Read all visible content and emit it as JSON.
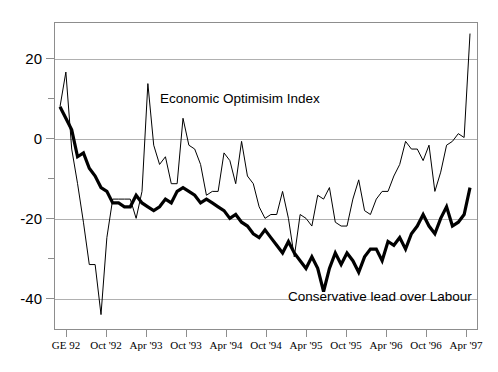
{
  "chart_data": {
    "type": "line",
    "title": "",
    "xlabel": "",
    "ylabel": "",
    "ylim": [
      -50,
      30
    ],
    "yticks": [
      20,
      0,
      -20,
      -40
    ],
    "ytick_labels": [
      "20",
      "0",
      "-20",
      "-40"
    ],
    "yticks_minor": [
      10,
      -10,
      -30
    ],
    "grid": true,
    "legend_position": "inline-annotations",
    "x_tick_labels": [
      "GE 92",
      "Oct '92",
      "Apr '93",
      "Oct '93",
      "Apr '94",
      "Oct '94",
      "Apr '95",
      "Oct '95",
      "Apr '96",
      "Oct '96",
      "Apr '97"
    ],
    "series": [
      {
        "name": "Economic Optimisim Index",
        "style": "thin",
        "color": "#000000",
        "values": [
          8,
          17,
          -3,
          -12,
          -22,
          -33,
          -33,
          -46,
          -26,
          -16,
          -16,
          -16,
          -16,
          -21,
          -14,
          14,
          -2,
          -7,
          -5,
          -12,
          -12,
          5,
          -2,
          -3,
          -7,
          -15,
          -14,
          -14,
          -4,
          -6,
          -12,
          -1,
          -10,
          -12,
          -18,
          -21,
          -20,
          -20,
          -14,
          -21,
          -31,
          -20,
          -21,
          -23,
          -15,
          -16,
          -13,
          -22,
          -23,
          -23,
          -16,
          -11,
          -19,
          -20,
          -16,
          -14,
          -14,
          -10,
          -7,
          -1,
          -3,
          -3,
          -6,
          -2,
          -14,
          -9,
          -2,
          -1,
          1,
          0,
          27
        ]
      },
      {
        "name": "Conservative lead over Labour",
        "style": "thick",
        "color": "#000000",
        "values": [
          8,
          5,
          2,
          -5,
          -4,
          -8,
          -10,
          -13,
          -14,
          -17,
          -17,
          -18,
          -18,
          -15,
          -17,
          -18,
          -19,
          -18,
          -16,
          -17,
          -14,
          -13,
          -14,
          -15,
          -17,
          -16,
          -17,
          -18,
          -19,
          -21,
          -20,
          -22,
          -23,
          -25,
          -26,
          -24,
          -26,
          -28,
          -30,
          -27,
          -30,
          -32,
          -34,
          -31,
          -34,
          -40,
          -34,
          -30,
          -33,
          -30,
          -32,
          -35,
          -31,
          -29,
          -29,
          -32,
          -27,
          -28,
          -26,
          -29,
          -25,
          -23,
          -20,
          -23,
          -25,
          -21,
          -18,
          -23,
          -22,
          -20,
          -13
        ]
      }
    ]
  },
  "annotations": {
    "optimism_label": "Economic Optimisim Index",
    "conservative_label": "Conservative lead over Labour"
  }
}
